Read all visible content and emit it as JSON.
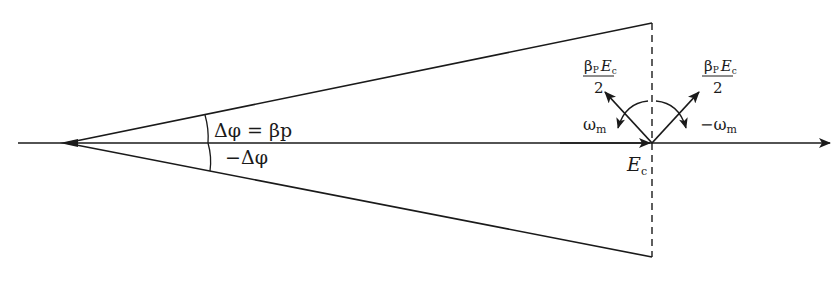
{
  "diagram": {
    "type": "phasor-cone",
    "colors": {
      "ink": "#1a1a1a",
      "background": "#ffffff"
    },
    "labels": {
      "delta_phi": "Δφ = βp",
      "neg_delta_phi": "−Δφ",
      "omega_left": "ωm",
      "omega_left_base": "ω",
      "omega_left_sub": "m",
      "omega_right_base": "−ω",
      "omega_right_sub": "m",
      "carrier_base": "E",
      "carrier_sub": "c",
      "sideband_left_num_beta": "β",
      "sideband_left_num_p": "P",
      "sideband_left_num_E": "E",
      "sideband_left_num_sub": "c",
      "sideband_left_den": "2",
      "sideband_right_num_beta": "β",
      "sideband_right_num_p": "P",
      "sideband_right_num_E": "E",
      "sideband_right_num_sub": "c",
      "sideband_right_den": "2"
    }
  }
}
